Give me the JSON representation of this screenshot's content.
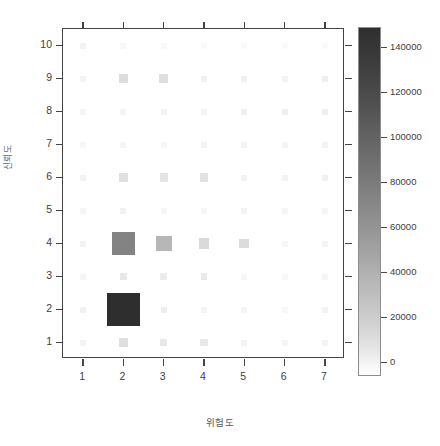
{
  "figure": {
    "title_sliver": "",
    "caption_sliver": "",
    "background": "#ffffff"
  },
  "axes": {
    "xlabel": "위험도",
    "ylabel": "신뢰도",
    "x_ticks": [
      "1",
      "2",
      "3",
      "4",
      "5",
      "6",
      "7"
    ],
    "y_ticks": [
      "10",
      "9",
      "8",
      "7",
      "6",
      "5",
      "4",
      "3",
      "2",
      "1"
    ]
  },
  "colorbar": {
    "ticks": [
      "140000",
      "120000",
      "100000",
      "80000",
      "60000",
      "40000",
      "20000",
      "0"
    ],
    "tick_values": [
      140000,
      120000,
      100000,
      80000,
      60000,
      40000,
      20000,
      0
    ],
    "min": 0,
    "max": 155000,
    "low_color": "#ffffff",
    "high_color": "#2f2f2f",
    "orientation": "vertical"
  },
  "chart_data": {
    "type": "heatmap",
    "title": "",
    "xlabel": "위험도",
    "ylabel": "신뢰도",
    "x": [
      1,
      2,
      3,
      4,
      5,
      6,
      7
    ],
    "y": [
      1,
      2,
      3,
      4,
      5,
      6,
      7,
      8,
      9,
      10
    ],
    "xlim": [
      0.5,
      7.5
    ],
    "ylim": [
      0.5,
      10.5
    ],
    "grid": false,
    "colorbar_label": "",
    "colormap": "grayscale-reversed",
    "value_range": [
      0,
      155000
    ],
    "note": "Cell area/shade encodes the mapped count; values listed row by row for y = 1..10",
    "rows": [
      {
        "y": 1,
        "values": [
          1200,
          7000,
          4200,
          4200,
          1400,
          900,
          1300
        ]
      },
      {
        "y": 2,
        "values": [
          1800,
          145000,
          2500,
          1100,
          900,
          700,
          1200
        ]
      },
      {
        "y": 3,
        "values": [
          900,
          4000,
          3200,
          3600,
          800,
          600,
          1100
        ]
      },
      {
        "y": 4,
        "values": [
          1500,
          62000,
          26000,
          9000,
          8000,
          700,
          1200
        ]
      },
      {
        "y": 5,
        "values": [
          1000,
          1800,
          900,
          1000,
          1200,
          900,
          1100
        ]
      },
      {
        "y": 6,
        "values": [
          1400,
          6500,
          5200,
          6000,
          1600,
          1200,
          2000
        ]
      },
      {
        "y": 7,
        "values": [
          800,
          900,
          700,
          1500,
          1300,
          1100,
          1400
        ]
      },
      {
        "y": 8,
        "values": [
          1100,
          1200,
          1500,
          1300,
          2000,
          2200,
          2400
        ]
      },
      {
        "y": 9,
        "values": [
          1300,
          7800,
          7000,
          1800,
          2100,
          1400,
          2300
        ]
      },
      {
        "y": 10,
        "values": [
          1600,
          600,
          500,
          400,
          400,
          300,
          300
        ]
      }
    ]
  }
}
